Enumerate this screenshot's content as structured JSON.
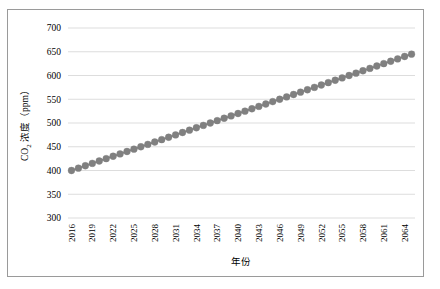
{
  "figure": {
    "background_color": "#ffffff",
    "border_color": "#9a9a9a"
  },
  "chart_data": {
    "type": "line",
    "title": "",
    "xlabel": "年份",
    "ylabel": "CO2 浓度（ppm）",
    "ylabel_main": "浓度（ppm）",
    "ylabel_prefix": "CO",
    "ylabel_subscript": "2",
    "marker_color": "#808080",
    "line_color": "#7f7f7f",
    "grid": true,
    "grid_color": "#d4d4d4",
    "legend": "none",
    "xlim": [
      2015.5,
      2065.5
    ],
    "ylim": [
      300,
      700
    ],
    "yticks": [
      300,
      350,
      400,
      450,
      500,
      550,
      600,
      650,
      700
    ],
    "ytick_labels": [
      "300",
      "350",
      "400",
      "450",
      "500",
      "550",
      "600",
      "650",
      "700"
    ],
    "xticks": [
      2016,
      2019,
      2022,
      2025,
      2028,
      2031,
      2034,
      2037,
      2040,
      2043,
      2046,
      2049,
      2052,
      2055,
      2058,
      2061,
      2064
    ],
    "xtick_labels": [
      "2016",
      "2019",
      "2022",
      "2025",
      "2028",
      "2031",
      "2034",
      "2037",
      "2040",
      "2043",
      "2046",
      "2049",
      "2052",
      "2055",
      "2058",
      "2061",
      "2064"
    ],
    "xtick_rotation": 90,
    "x": [
      2016,
      2017,
      2018,
      2019,
      2020,
      2021,
      2022,
      2023,
      2024,
      2025,
      2026,
      2027,
      2028,
      2029,
      2030,
      2031,
      2032,
      2033,
      2034,
      2035,
      2036,
      2037,
      2038,
      2039,
      2040,
      2041,
      2042,
      2043,
      2044,
      2045,
      2046,
      2047,
      2048,
      2049,
      2050,
      2051,
      2052,
      2053,
      2054,
      2055,
      2056,
      2057,
      2058,
      2059,
      2060,
      2061,
      2062,
      2063,
      2064,
      2065
    ],
    "values": [
      400,
      405,
      410,
      415,
      420,
      425,
      430,
      435,
      440,
      445,
      450,
      455,
      460,
      465,
      470,
      475,
      480,
      485,
      490,
      495,
      500,
      505,
      510,
      515,
      520,
      525,
      530,
      535,
      540,
      545,
      550,
      555,
      560,
      565,
      570,
      575,
      580,
      585,
      590,
      595,
      600,
      605,
      610,
      615,
      620,
      625,
      630,
      635,
      640,
      645
    ],
    "series": [
      {
        "name": "CO2 浓度",
        "marker": "circle",
        "marker_size": 4.6
      }
    ]
  }
}
